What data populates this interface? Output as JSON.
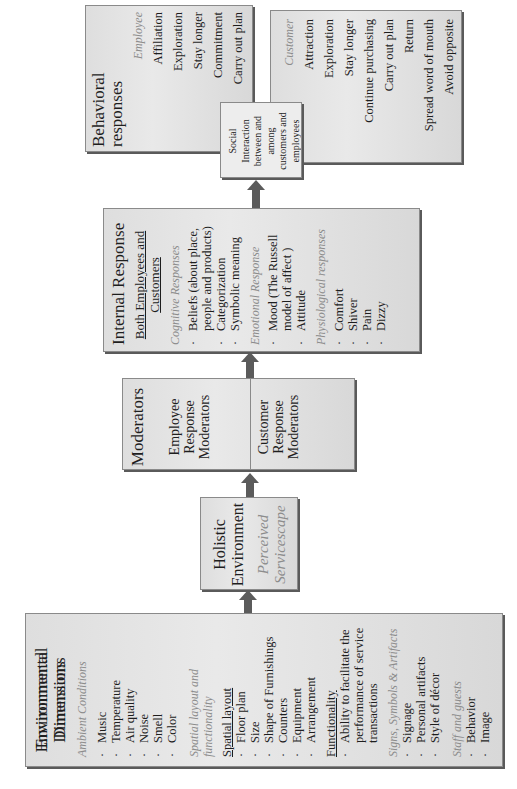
{
  "orientation": "rotated-90-ccw",
  "colors": {
    "box_fill": "#e2e2e2",
    "box_border": "#8a8a8a",
    "arrow": "#5b5b5b",
    "subheading": "#8c8c8c"
  },
  "environmental": {
    "title_line1": "Environmental",
    "title_line2": "Dimensions",
    "ambient": {
      "heading": "Ambient Conditions",
      "items": [
        "Music",
        "Temperature",
        "Air quality",
        "Noise",
        "Smell",
        "Color"
      ]
    },
    "spatial_heading_line1": "Spatial layout and",
    "spatial_heading_line2": "functionality",
    "spatial": {
      "heading": "Spatial layout",
      "items": [
        "Floor plan",
        "Size",
        "Shape of Furnishings",
        "Counters",
        "Equipment",
        "Arrangement"
      ]
    },
    "functionality": {
      "heading": "Functionality",
      "item_line1": "Ability to facilitate the",
      "item_line2": "performance of service",
      "item_line3": "transactions"
    },
    "signs": {
      "heading": "Signs, Symbols & Artifacts",
      "items": [
        "Signage",
        "Personal artifacts",
        "Style of décor"
      ]
    },
    "staff": {
      "heading": "Staff and guests",
      "items": [
        "Behavior",
        "Image"
      ]
    }
  },
  "holistic": {
    "title_line1": "Holistic",
    "title_line2": "Environment",
    "sub_line1": "Perceived",
    "sub_line2": "Servicescape"
  },
  "moderators": {
    "title": "Moderators",
    "employee": [
      "Employee",
      "Response",
      "Moderators"
    ],
    "customer": [
      "Customer",
      "Response",
      "Moderators"
    ]
  },
  "internal": {
    "title": "Internal Response",
    "both_line1": "Both Employees and",
    "both_line2": "Customers",
    "cognitive": {
      "heading": "Cognitive Responses",
      "belief_line1": "Beliefs (about place,",
      "belief_line2": "people and products)",
      "items": [
        "Categorization",
        "Symbolic meaning"
      ]
    },
    "emotional": {
      "heading": "Emotional Response",
      "mood_line1": "Mood (The Russell",
      "mood_line2": "model of affect )",
      "items": [
        "Attitude"
      ]
    },
    "physiological": {
      "heading": "Physiological responses",
      "items": [
        "Comfort",
        "Shiver",
        "Pain",
        "Dizzy"
      ]
    }
  },
  "social": {
    "lines": [
      "Social",
      "Interaction",
      "between and",
      "among",
      "customers and",
      "employees"
    ]
  },
  "behavioral": {
    "title": "Behavioral responses",
    "employee": {
      "heading": "Employee",
      "items": [
        "Affiliation",
        "Exploration",
        "Stay longer",
        "Commitment",
        "Carry out plan",
        "Avoid opposite"
      ]
    },
    "customer": {
      "heading": "Customer",
      "items": [
        "Attraction",
        "Exploration",
        "Stay longer",
        "Continue purchasing",
        "Carry out plan",
        "Return",
        "Spread word of mouth",
        "Avoid opposite"
      ]
    }
  }
}
